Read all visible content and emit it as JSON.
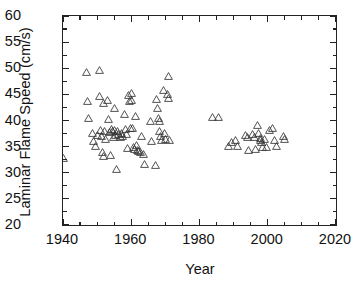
{
  "chart_data": {
    "type": "scatter",
    "title": "",
    "xlabel": "Year",
    "ylabel": "Laminar Flame Speed (cm/s)",
    "xlim": [
      1940,
      2020
    ],
    "ylim": [
      20,
      60
    ],
    "xticks": [
      1940,
      1960,
      1980,
      2000,
      2020
    ],
    "xtick_labels": [
      "1940",
      "1960",
      "1980",
      "2000",
      "2020"
    ],
    "x_minor_step": 5,
    "yticks": [
      20,
      25,
      30,
      35,
      40,
      45,
      50,
      55,
      60
    ],
    "ytick_labels": [
      "20",
      "25",
      "30",
      "35",
      "40",
      "45",
      "50",
      "55",
      "60"
    ],
    "y_minor_step": 2.5,
    "grid": false,
    "legend": null,
    "marker": "open-triangle-up",
    "marker_color": "#333333",
    "series": [
      {
        "name": "Laminar flame speed measurements",
        "points": [
          [
            1940.0,
            32.8
          ],
          [
            1947.0,
            49.2
          ],
          [
            1947.2,
            43.8
          ],
          [
            1947.6,
            40.5
          ],
          [
            1948.5,
            37.6
          ],
          [
            1948.8,
            36.0
          ],
          [
            1949.5,
            35.2
          ],
          [
            1950.0,
            37.3
          ],
          [
            1950.6,
            49.7
          ],
          [
            1950.8,
            44.6
          ],
          [
            1951.0,
            38.2
          ],
          [
            1951.3,
            37.0
          ],
          [
            1951.5,
            34.0
          ],
          [
            1951.8,
            33.3
          ],
          [
            1952.0,
            43.4
          ],
          [
            1952.3,
            38.0
          ],
          [
            1952.6,
            36.4
          ],
          [
            1953.0,
            44.0
          ],
          [
            1953.2,
            40.3
          ],
          [
            1953.6,
            37.8
          ],
          [
            1953.9,
            33.4
          ],
          [
            1954.2,
            38.4
          ],
          [
            1954.5,
            37.9
          ],
          [
            1954.8,
            36.8
          ],
          [
            1955.0,
            42.4
          ],
          [
            1955.2,
            38.1
          ],
          [
            1955.5,
            37.2
          ],
          [
            1955.8,
            30.8
          ],
          [
            1956.0,
            38.0
          ],
          [
            1956.4,
            37.4
          ],
          [
            1956.8,
            36.9
          ],
          [
            1957.0,
            37.6
          ],
          [
            1957.5,
            37.1
          ],
          [
            1958.0,
            41.3
          ],
          [
            1958.3,
            38.3
          ],
          [
            1958.6,
            37.5
          ],
          [
            1958.9,
            34.7
          ],
          [
            1959.2,
            44.8
          ],
          [
            1959.5,
            43.7
          ],
          [
            1959.8,
            38.6
          ],
          [
            1960.0,
            45.2
          ],
          [
            1960.2,
            43.9
          ],
          [
            1960.5,
            38.5
          ],
          [
            1960.8,
            35.0
          ],
          [
            1960.9,
            34.6
          ],
          [
            1961.2,
            40.8
          ],
          [
            1961.5,
            35.3
          ],
          [
            1961.8,
            34.4
          ],
          [
            1962.2,
            34.1
          ],
          [
            1962.6,
            33.9
          ],
          [
            1963.0,
            37.0
          ],
          [
            1963.5,
            33.6
          ],
          [
            1964.0,
            31.6
          ],
          [
            1965.5,
            40.0
          ],
          [
            1966.0,
            36.0
          ],
          [
            1967.0,
            31.5
          ],
          [
            1967.5,
            44.2
          ],
          [
            1967.8,
            42.4
          ],
          [
            1968.0,
            40.5
          ],
          [
            1968.2,
            40.0
          ],
          [
            1968.4,
            37.9
          ],
          [
            1968.6,
            37.0
          ],
          [
            1968.8,
            36.3
          ],
          [
            1969.5,
            45.9
          ],
          [
            1969.8,
            37.6
          ],
          [
            1970.0,
            36.4
          ],
          [
            1970.5,
            45.1
          ],
          [
            1970.8,
            44.3
          ],
          [
            1971.0,
            48.6
          ],
          [
            1971.2,
            36.2
          ],
          [
            1983.8,
            40.6
          ],
          [
            1985.5,
            40.6
          ],
          [
            1988.5,
            35.1
          ],
          [
            1989.5,
            35.9
          ],
          [
            1990.5,
            36.2
          ],
          [
            1991.0,
            35.2
          ],
          [
            1993.5,
            37.2
          ],
          [
            1994.0,
            36.9
          ],
          [
            1994.5,
            34.4
          ],
          [
            1995.5,
            37.4
          ],
          [
            1996.0,
            36.8
          ],
          [
            1996.5,
            34.6
          ],
          [
            1997.0,
            39.1
          ],
          [
            1997.4,
            37.6
          ],
          [
            1997.8,
            36.6
          ],
          [
            1998.0,
            36.2
          ],
          [
            1998.3,
            35.9
          ],
          [
            1998.6,
            35.0
          ],
          [
            1999.0,
            36.5
          ],
          [
            1999.5,
            34.9
          ],
          [
            2000.5,
            38.2
          ],
          [
            2001.5,
            38.5
          ],
          [
            2002.0,
            36.3
          ],
          [
            2002.5,
            35.2
          ],
          [
            2004.5,
            37.1
          ],
          [
            2005.0,
            36.4
          ]
        ]
      }
    ]
  }
}
